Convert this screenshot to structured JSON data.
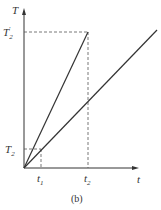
{
  "figure": {
    "caption": "(b)",
    "y_axis_label": "T",
    "x_axis_label": "t",
    "y_ticks": [
      {
        "main": "T",
        "sub": "2",
        "prime": "′",
        "name": "T2-prime"
      },
      {
        "main": "T",
        "sub": "2",
        "prime": "",
        "name": "T2"
      }
    ],
    "x_ticks": [
      {
        "main": "t",
        "sub": "1",
        "name": "t1"
      },
      {
        "main": "t",
        "sub": "2",
        "name": "t2"
      }
    ],
    "lines": [
      {
        "name": "steep-line",
        "from": [
          0,
          0
        ],
        "to": [
          "t2",
          "T2'"
        ]
      },
      {
        "name": "shallow-line",
        "from": [
          0,
          0
        ],
        "to": [
          "beyond t2",
          "above T2'"
        ]
      }
    ],
    "colors": {
      "line": "#333333",
      "dash": "#555555"
    }
  }
}
